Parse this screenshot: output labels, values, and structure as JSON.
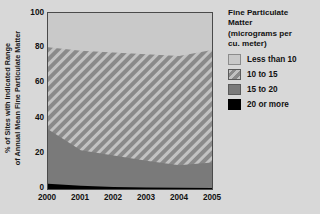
{
  "chart_data": {
    "type": "area",
    "title": "",
    "subtitle": "",
    "xlabel": "",
    "ylabel": "% of Sites with Indicated Range of Annual Mean Fine Particulate Matter",
    "ylabel_lines": [
      "% of Sites with Indicated Range",
      "of Annual Mean Fine Particulate Matter"
    ],
    "stacked": true,
    "stack_order": "bottom-to-top",
    "x": [
      2000,
      2001,
      2002,
      2003,
      2004,
      2005
    ],
    "categories": [
      "2000",
      "2001",
      "2002",
      "2003",
      "2004",
      "2005"
    ],
    "xlim": [
      2000,
      2005
    ],
    "ylim": [
      0,
      100
    ],
    "yticks": [
      0,
      20,
      40,
      60,
      80,
      100
    ],
    "ytick_labels": [
      "0",
      "20",
      "40",
      "60",
      "80",
      "100"
    ],
    "xticks": [
      2000,
      2001,
      2002,
      2003,
      2004,
      2005
    ],
    "xtick_labels": [
      "2000",
      "2001",
      "2002",
      "2003",
      "2004",
      "2005"
    ],
    "grid": false,
    "legend_position": "right",
    "series": [
      {
        "name": "20 or more",
        "fill": "#000000",
        "pattern": "solid",
        "values": [
          3.0,
          1.8,
          1.2,
          0.9,
          0.7,
          0.6
        ]
      },
      {
        "name": "15 to 20",
        "fill": "#7a7a7a",
        "pattern": "solid",
        "values": [
          31.0,
          20.2,
          17.8,
          15.1,
          12.8,
          14.4
        ]
      },
      {
        "name": "10 to 15",
        "fill": "#8a8a8a",
        "pattern": "diagonal-hatch",
        "values": [
          46.5,
          56.5,
          58.5,
          60.5,
          62.0,
          64.0
        ]
      },
      {
        "name": "Less than 10",
        "fill": "#c9c9c9",
        "pattern": "solid",
        "values": [
          19.5,
          21.5,
          22.5,
          23.5,
          24.5,
          21.0
        ]
      }
    ],
    "cumulative_upper_bounds": {
      "20 or more": [
        3.0,
        1.8,
        1.2,
        0.9,
        0.7,
        0.6
      ],
      "15 to 20": [
        34.0,
        22.0,
        19.0,
        16.0,
        13.5,
        15.0
      ],
      "10 to 15": [
        80.5,
        78.5,
        77.5,
        76.5,
        75.5,
        79.0
      ],
      "Less than 10": [
        100,
        100,
        100,
        100,
        100,
        100
      ]
    }
  },
  "legend": {
    "title_lines": [
      "Fine Particulate",
      "Matter",
      "(micrograms per",
      "cu. meter)"
    ],
    "items": [
      {
        "label": "Less than 10",
        "swatch": "light-gray-swatch"
      },
      {
        "label": "10 to 15",
        "swatch": "hatched-swatch"
      },
      {
        "label": "15 to 20",
        "swatch": "medium-gray-swatch"
      },
      {
        "label": "20 or more",
        "swatch": "black-swatch"
      }
    ]
  },
  "colors": {
    "background": "#d8d8d8",
    "plot_background": "#c9c9c9",
    "axis": "#4a4a4a",
    "less_than_10": "#c9c9c9",
    "ten_to_15_base": "#8a8a8a",
    "ten_to_15_stripe": "#c2c2c2",
    "fifteen_to_20": "#7a7a7a",
    "twenty_or_more": "#000000",
    "text": "#111111"
  }
}
